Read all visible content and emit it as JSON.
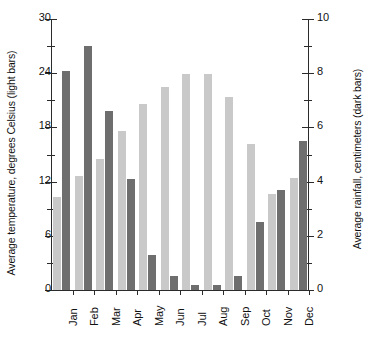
{
  "chart_data": {
    "type": "bar",
    "title": "",
    "subtitle": "",
    "xlabel": "",
    "categories": [
      "Jan",
      "Feb",
      "Mar",
      "Apr",
      "May",
      "Jun",
      "Jul",
      "Aug",
      "Sep",
      "Oct",
      "Nov",
      "Dec"
    ],
    "series": [
      {
        "name": "Average temperature, degrees Celsius (light bars)",
        "axis": "left",
        "unit": "degrees Celsius",
        "color": "#c9c9c9",
        "values": [
          10.3,
          12.6,
          14.5,
          17.6,
          20.6,
          22.5,
          23.9,
          23.9,
          21.4,
          16.2,
          10.6,
          12.4
        ]
      },
      {
        "name": "Average rainfall, centimeters (dark bars)",
        "axis": "right",
        "unit": "centimeters",
        "color": "#6e6e6e",
        "values": [
          8.1,
          9.0,
          6.6,
          4.1,
          1.3,
          0.5,
          0.2,
          0.2,
          0.5,
          2.5,
          3.7,
          5.5
        ]
      }
    ],
    "left_axis": {
      "label": "Average temperature, degrees Celsius (light bars)",
      "min": 0,
      "max": 30,
      "major_ticks": [
        0,
        6,
        12,
        18,
        24,
        30
      ],
      "minor_ticks": [
        3,
        9,
        15,
        21,
        27
      ],
      "tick_labels": [
        "0",
        "6",
        "12",
        "18",
        "24",
        "30"
      ]
    },
    "right_axis": {
      "label": "Average rainfall, centimeters (dark bars)",
      "min": 0,
      "max": 10,
      "major_ticks": [
        0,
        2,
        4,
        6,
        8,
        10
      ],
      "minor_ticks": [
        1,
        3,
        5,
        7,
        9
      ],
      "tick_labels": [
        "0",
        "2",
        "4",
        "6",
        "8",
        "10"
      ]
    },
    "grid": false,
    "legend": "encoded-in-axis-labels"
  }
}
